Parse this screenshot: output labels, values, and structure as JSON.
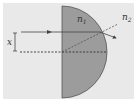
{
  "diagram": {
    "title": "",
    "labels": {
      "n1": {
        "base": "n",
        "sub": "1"
      },
      "n2": {
        "base": "n",
        "sub": "2"
      },
      "x": "x"
    },
    "colors": {
      "background": "#e9e9e9",
      "lens_fill": "#9c9c9c",
      "lens_stroke": "#555555",
      "ray": "#444444",
      "dashed": "#333333"
    },
    "nodes": [
      {
        "id": "lens",
        "type": "semicircle",
        "label": "n1"
      },
      {
        "id": "medium",
        "type": "background-region",
        "label": "n2"
      }
    ],
    "edges": [
      {
        "id": "incident-ray",
        "from": "left",
        "to": "lens-curved-surface",
        "style": "solid-arrow"
      },
      {
        "id": "refracted-ray",
        "from": "lens-curved-surface",
        "to": "right",
        "style": "solid-arrow"
      },
      {
        "id": "normal-line",
        "from": "lens-center",
        "to": "n2-region",
        "style": "dashed"
      },
      {
        "id": "optical-axis",
        "from": "left",
        "to": "lens-curved-surface",
        "style": "dashed"
      },
      {
        "id": "height-marker",
        "label": "x",
        "style": "double-arrow"
      }
    ]
  }
}
